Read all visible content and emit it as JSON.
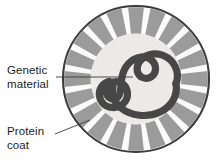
{
  "figure": {
    "background_color": "#ffffff",
    "width": 221,
    "height": 165
  },
  "labels": {
    "genetic_material": {
      "line1": "Genetic",
      "line2": "material",
      "leader_line": "horizontal"
    },
    "protein_coat": {
      "line1": "Protein",
      "line2": "coat",
      "leader_line": "diagonal"
    }
  },
  "diagram": {
    "type": "virus-cross-section",
    "center_x": 136,
    "center_y": 79,
    "outer_radius": 73,
    "inner_radius": 45.5,
    "capsomere_count": 20,
    "colors": {
      "outline": "#3c3c3c",
      "capsid_segment": "#9b9b9b",
      "capsid_gap": "#fbfbfb",
      "inner_fill": "#eceae7",
      "genetic_strand": "#474747",
      "leader_line": "#3a3a3a",
      "text": "#1d1d1d"
    },
    "genetic_strand_width": 7.2
  }
}
